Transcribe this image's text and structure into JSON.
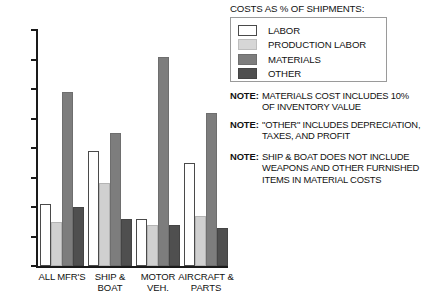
{
  "legend": {
    "title": "COSTS AS % OF SHIPMENTS:",
    "items": [
      {
        "label": "LABOR",
        "key": "labor",
        "color": "#ffffff"
      },
      {
        "label": "PRODUCTION LABOR",
        "key": "prodlabor",
        "color": "#d6d6d6"
      },
      {
        "label": "MATERIALS",
        "key": "materials",
        "color": "#7d7d7d"
      },
      {
        "label": "OTHER",
        "key": "other",
        "color": "#4f4f4f"
      }
    ]
  },
  "notes": [
    {
      "tag": "NOTE:",
      "text": "MATERIALS COST INCLUDES 10%\nOF INVENTORY VALUE"
    },
    {
      "tag": "NOTE:",
      "text": "\"OTHER\" INCLUDES DEPRECIATION,\nTAXES, AND PROFIT"
    },
    {
      "tag": "NOTE:",
      "text": "SHIP & BOAT DOES NOT INCLUDE\nWEAPONS AND OTHER FURNISHED\nITEMS IN MATERIAL COSTS"
    }
  ],
  "axis": {
    "y_ticks": [
      "0",
      "10",
      "20",
      "30",
      "40",
      "50",
      "60",
      "70",
      "80"
    ]
  },
  "chart_data": {
    "type": "bar",
    "title": "COSTS AS % OF SHIPMENTS:",
    "xlabel": "",
    "ylabel": "",
    "ylim": [
      0,
      80
    ],
    "ytick_step": 10,
    "grid": false,
    "legend_position": "top-right",
    "categories": [
      "ALL MFR'S",
      "SHIP &\nBOAT",
      "MOTOR\nVEH.",
      "AIRCRAFT &\nPARTS"
    ],
    "series": [
      {
        "name": "LABOR",
        "color": "#ffffff",
        "values": [
          21,
          39,
          16,
          35
        ]
      },
      {
        "name": "PRODUCTION LABOR",
        "color": "#d6d6d6",
        "values": [
          15,
          28,
          14,
          17
        ]
      },
      {
        "name": "MATERIALS",
        "color": "#7d7d7d",
        "values": [
          59,
          45,
          71,
          52
        ]
      },
      {
        "name": "OTHER",
        "color": "#4f4f4f",
        "values": [
          20,
          16,
          14,
          13
        ]
      }
    ]
  }
}
